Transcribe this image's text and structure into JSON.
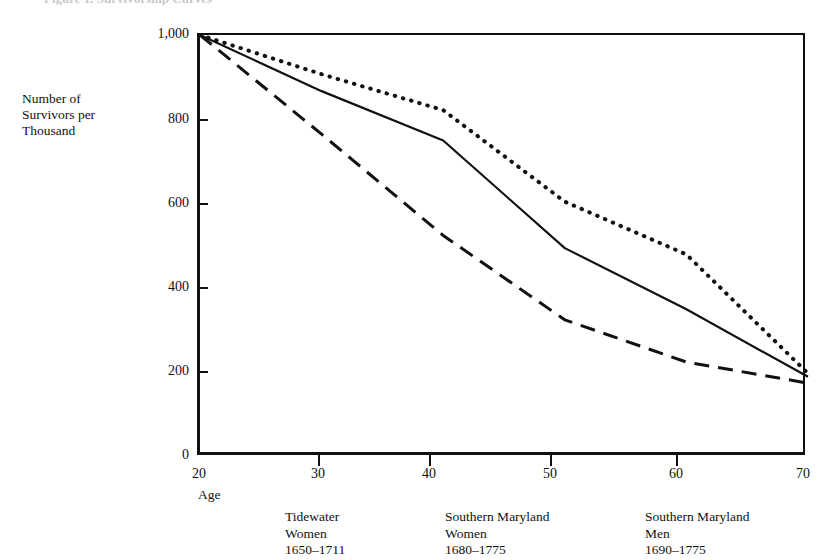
{
  "figure": {
    "title_remnant": "Figure 1.  Survivorship Curves",
    "axis": {
      "y_title_lines": [
        "Number of",
        "Survivors per",
        "Thousand"
      ],
      "y_ticks": [
        "0",
        "200",
        "400",
        "600",
        "800",
        "1,000"
      ],
      "x_ticks": [
        "20",
        "30",
        "40",
        "50",
        "60",
        "70"
      ],
      "x_title": "Age"
    },
    "legend": [
      {
        "line1": "Tidewater",
        "line2": "Women",
        "line3": "1650–1711"
      },
      {
        "line1": "Southern Maryland",
        "line2": "Women",
        "line3": "1680–1775"
      },
      {
        "line1": "Southern Maryland",
        "line2": "Men",
        "line3": "1690–1775"
      }
    ]
  },
  "chart_data": {
    "type": "line",
    "title": "Figure 1.  Survivorship Curves",
    "xlabel": "Age",
    "ylabel": "Number of Survivors per Thousand",
    "xlim": [
      20,
      70
    ],
    "ylim": [
      0,
      1000
    ],
    "xticks": [
      20,
      30,
      40,
      50,
      60,
      70
    ],
    "yticks": [
      0,
      200,
      400,
      600,
      800,
      1000
    ],
    "grid": false,
    "legend_position": "below-axes",
    "x": [
      20,
      30,
      40,
      50,
      60,
      70
    ],
    "series": [
      {
        "name": "Southern Maryland Women 1680–1775",
        "style": "dotted",
        "color": "#111111",
        "values": [
          1000,
          907,
          822,
          605,
          480,
          198
        ]
      },
      {
        "name": "Tidewater Women 1650–1711",
        "style": "solid",
        "color": "#111111",
        "values": [
          1000,
          867,
          750,
          495,
          350,
          190
        ]
      },
      {
        "name": "Southern Maryland Men 1690–1775",
        "style": "dashed",
        "color": "#111111",
        "values": [
          1000,
          765,
          525,
          325,
          225,
          175
        ]
      }
    ]
  }
}
